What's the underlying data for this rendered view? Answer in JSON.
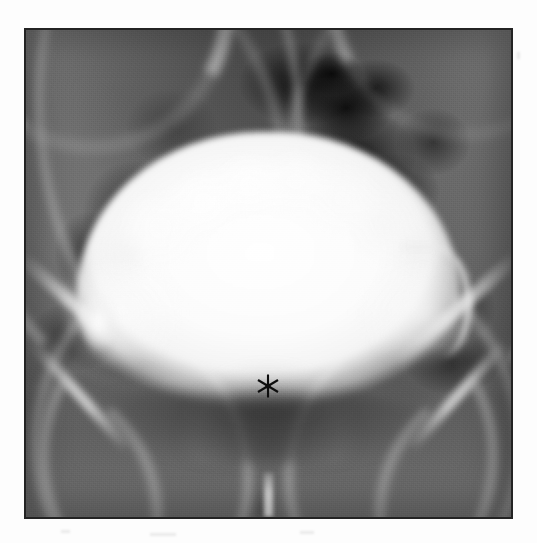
{
  "document": {
    "type": "radiograph",
    "modality": "Cystogram (contrast-filled urinary bladder, AP projection)",
    "background_color": "#fdfdfd",
    "frame_color": "#232323",
    "plate_base_color": "#6b6b6b"
  },
  "frame": {
    "x": 24,
    "y": 28,
    "width": 489,
    "height": 491,
    "border_width_px": 2
  },
  "annotations": {
    "asterisk": {
      "symbol": "*",
      "color": "#0d0d0d",
      "x": 268,
      "y": 386,
      "points": 6,
      "radius_px": 12,
      "meaning": "prostatic impression at bladder base"
    }
  },
  "anatomy": {
    "regions": [
      {
        "name": "bladder-contrast",
        "label": "Contrast-filled urinary bladder",
        "tone": "#fbfbfb"
      },
      {
        "name": "bladder-dome-lobulation",
        "label": "Lobulated superior bladder contour",
        "tone": "#f4f4f4"
      },
      {
        "name": "bladder-diverticulum-left",
        "label": "Left lateral bladder outpouching",
        "tone": "#f8f8f8"
      },
      {
        "name": "prostatic-impression",
        "label": "Prostatic impression on bladder base",
        "tone": "#5a5a5a"
      },
      {
        "name": "pelvic-bone-arcs",
        "label": "Iliac wings and pelvic brim",
        "tone": "#cfcfcf"
      },
      {
        "name": "bone-pubic-arch",
        "label": "Pubic arch",
        "tone": "#dedede"
      },
      {
        "name": "pubic-symphysis",
        "label": "Pubic symphysis",
        "tone": "#ececec"
      },
      {
        "name": "bowel-gas-shadows",
        "label": "Bowel gas lucencies",
        "tone": "#0d0d0d"
      },
      {
        "name": "soft-tissue-background",
        "label": "Pelvic soft tissue",
        "tone": "#606060"
      }
    ]
  },
  "palette": {
    "paper_white": "#fdfdfd",
    "contrast_white": "#fbfbfb",
    "soft_tissue_gray": "#606060",
    "gas_black": "#0a0a0a",
    "bone_light": "#dcdcdc",
    "marker_black": "#0d0d0d"
  }
}
